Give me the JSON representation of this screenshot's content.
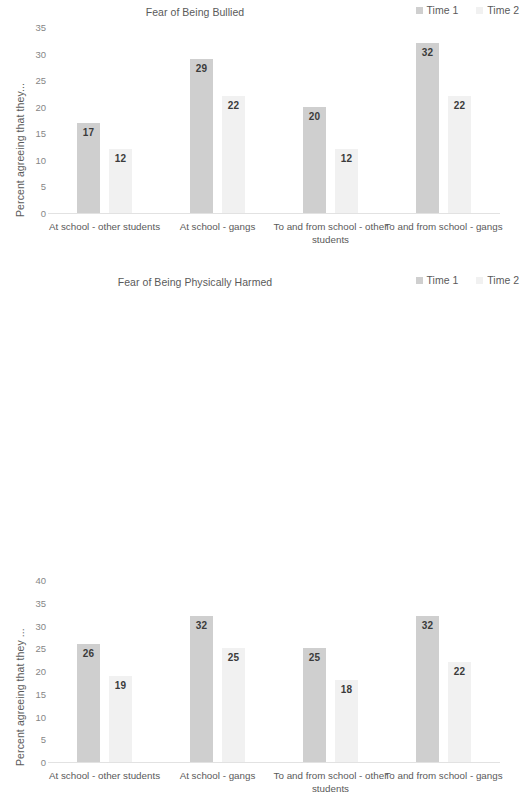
{
  "colors": {
    "time1": "#cfcfcf",
    "time2": "#f1f1f1",
    "text": "#5a5a5a",
    "tick": "#868686",
    "label": "#3b3b3b",
    "axis_line": "#e2e2e2",
    "background": "#ffffff"
  },
  "legend": {
    "series": [
      {
        "label": "Time 1",
        "color": "#cfcfcf"
      },
      {
        "label": "Time 2",
        "color": "#f1f1f1"
      }
    ]
  },
  "chart_data": [
    {
      "id": "fear-of-being-bullied",
      "type": "bar",
      "title": "Fear of Being Bullied",
      "xlabel": "",
      "ylabel": "Percent agreeing that they...",
      "ylim": [
        0,
        35
      ],
      "yticks": [
        0,
        5,
        10,
        15,
        20,
        25,
        30,
        35
      ],
      "ytick_labels": [
        "0",
        "5",
        "10",
        "15",
        "20",
        "25",
        "30",
        "35"
      ],
      "grid": false,
      "legend_position": "top-right",
      "categories": [
        "At school - other students",
        "At school - gangs",
        "To and from school - other students",
        "To and from school - gangs"
      ],
      "series": [
        {
          "name": "Time 1",
          "color": "#cfcfcf",
          "values": [
            17,
            29,
            20,
            32
          ]
        },
        {
          "name": "Time 2",
          "color": "#f1f1f1",
          "values": [
            12,
            22,
            12,
            22
          ]
        }
      ]
    },
    {
      "id": "fear-of-being-physically-harmed",
      "type": "bar",
      "title": "Fear of Being Physically Harmed",
      "xlabel": "",
      "ylabel": "Percent agreeing that they ...",
      "ylim": [
        0,
        40
      ],
      "yticks": [
        0,
        5,
        10,
        15,
        20,
        25,
        30,
        35,
        40
      ],
      "ytick_labels": [
        "0",
        "5",
        "10",
        "15",
        "20",
        "25",
        "30",
        "35",
        "40"
      ],
      "grid": false,
      "legend_position": "top-right",
      "categories": [
        "At school - other students",
        "At school - gangs",
        "To and from school - other students",
        "To and from school - gangs"
      ],
      "series": [
        {
          "name": "Time 1",
          "color": "#cfcfcf",
          "values": [
            26,
            32,
            25,
            32
          ]
        },
        {
          "name": "Time 2",
          "color": "#f1f1f1",
          "values": [
            19,
            25,
            18,
            22
          ]
        }
      ]
    }
  ]
}
